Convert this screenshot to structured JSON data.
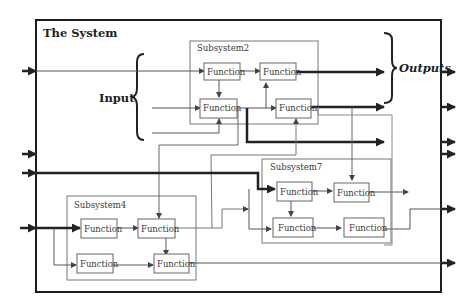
{
  "diagram": {
    "title": "The System",
    "input_label": "Input",
    "outputs_label": "Outputs",
    "subsystems": [
      {
        "id": "subsystem2",
        "label": "Subsystem2",
        "functions": [
          "Function",
          "Function",
          "Function",
          "Function"
        ]
      },
      {
        "id": "subsystem4",
        "label": "Subsystem4",
        "functions": [
          "Function",
          "Function",
          "Function",
          "Function"
        ]
      },
      {
        "id": "subsystem7",
        "label": "Subsystem7",
        "functions": [
          "Function",
          "Function",
          "Function",
          "Function"
        ]
      }
    ],
    "colors": {
      "outer_border": "#1e1e1e",
      "subsystem_border": "#777777",
      "function_border": "#666666",
      "thin_line": "#7a7a7a",
      "thick_line": "#222222"
    }
  }
}
